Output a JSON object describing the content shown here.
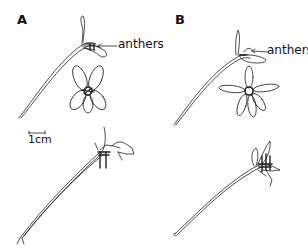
{
  "figure": {
    "panels": [
      {
        "label": "A",
        "callout": "anthers"
      },
      {
        "label": "B",
        "callout": "anthers"
      }
    ],
    "scale_bar": {
      "label": "1cm"
    }
  },
  "colors": {
    "ink": "#111111",
    "background": "#ffffff"
  }
}
